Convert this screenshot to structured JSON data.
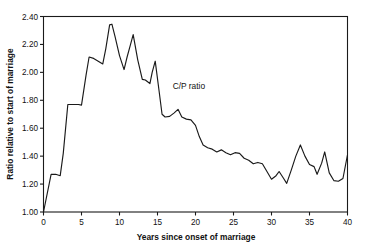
{
  "chart_data": {
    "type": "line",
    "title": "",
    "xlabel": "Years since onset of marriage",
    "ylabel": "Ratio relative to start of marriage",
    "xlim": [
      0,
      40
    ],
    "ylim": [
      1.0,
      2.4
    ],
    "grid": false,
    "legend_position": "none",
    "line_color": "#1a1a1a",
    "annotations": [
      {
        "text": "C/P ratio",
        "x": 17.0,
        "y": 1.88
      }
    ],
    "xticks": [
      0,
      5,
      10,
      15,
      20,
      25,
      30,
      35,
      40
    ],
    "xtick_labels": [
      "0",
      "5",
      "10",
      "15",
      "20",
      "25",
      "30",
      "35",
      "40"
    ],
    "yticks": [
      1.0,
      1.2,
      1.4,
      1.6,
      1.8,
      2.0,
      2.2,
      2.4
    ],
    "ytick_labels": [
      "1.00",
      "1.20",
      "1.40",
      "1.60",
      "1.80",
      "2.00",
      "2.20",
      "2.40"
    ],
    "series": [
      {
        "name": "C/P ratio",
        "x": [
          0.0,
          1.0,
          1.6,
          2.2,
          2.6,
          3.2,
          4.6,
          5.0,
          5.6,
          6.0,
          6.6,
          7.2,
          7.8,
          8.2,
          8.7,
          9.0,
          9.4,
          10.0,
          10.6,
          11.0,
          11.4,
          11.8,
          12.4,
          13.0,
          13.4,
          14.0,
          14.3,
          14.7,
          15.2,
          15.6,
          16.0,
          16.6,
          17.2,
          17.7,
          18.2,
          18.8,
          19.4,
          20.0,
          20.5,
          21.0,
          21.6,
          22.2,
          22.8,
          23.4,
          24.0,
          24.6,
          25.2,
          25.8,
          26.4,
          27.0,
          27.6,
          28.2,
          28.8,
          29.4,
          30.0,
          30.6,
          31.0,
          31.6,
          32.0,
          32.6,
          33.2,
          33.8,
          34.4,
          35.0,
          35.6,
          36.0,
          36.6,
          37.0,
          37.6,
          38.2,
          38.8,
          39.4,
          40.0
        ],
        "y": [
          1.0,
          1.27,
          1.27,
          1.26,
          1.42,
          1.77,
          1.77,
          1.765,
          1.98,
          2.11,
          2.1,
          2.08,
          2.06,
          2.17,
          2.34,
          2.345,
          2.26,
          2.12,
          2.02,
          2.11,
          2.19,
          2.27,
          2.09,
          1.95,
          1.945,
          1.92,
          2.0,
          2.08,
          1.87,
          1.7,
          1.68,
          1.685,
          1.71,
          1.735,
          1.68,
          1.665,
          1.66,
          1.62,
          1.54,
          1.48,
          1.46,
          1.45,
          1.43,
          1.445,
          1.425,
          1.41,
          1.425,
          1.42,
          1.385,
          1.37,
          1.345,
          1.355,
          1.345,
          1.29,
          1.235,
          1.26,
          1.29,
          1.24,
          1.205,
          1.3,
          1.4,
          1.48,
          1.4,
          1.34,
          1.325,
          1.27,
          1.35,
          1.43,
          1.28,
          1.225,
          1.22,
          1.24,
          1.41
        ]
      }
    ]
  }
}
